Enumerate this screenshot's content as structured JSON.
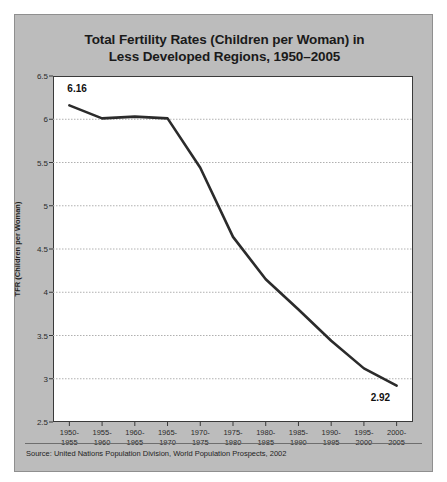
{
  "title": {
    "line1": "Total Fertility Rates (Children per Woman) in",
    "line2": "Less Developed Regions, 1950–2005"
  },
  "source": "Source: United Nations Population Division, World Population Prospects, 2002",
  "colors": {
    "panel_background": "#bcbcbc",
    "plot_background": "#ffffff",
    "line": "#2b2b2b",
    "gridline": "#b0b0b0",
    "axis": "#3a3a3a",
    "text": "#1a1a1a"
  },
  "annotations": {
    "first_value_label": "6.16",
    "last_value_label": "2.92"
  },
  "chart_data": {
    "type": "line",
    "title": "Total Fertility Rates (Children per Woman) in Less Developed Regions, 1950–2005",
    "xlabel": "",
    "ylabel": "TFR (Children per Woman)",
    "ylim": [
      2.5,
      6.5
    ],
    "ytick_labels": [
      "2.5",
      "3",
      "3.5",
      "4",
      "4.5",
      "5",
      "5.5",
      "6",
      "6.5"
    ],
    "yticks": [
      2.5,
      3,
      3.5,
      4,
      4.5,
      5,
      5.5,
      6,
      6.5
    ],
    "grid": true,
    "legend": false,
    "categories": [
      "1950-1955",
      "1955-1960",
      "1960-1965",
      "1965-1970",
      "1970-1975",
      "1975-1980",
      "1980-1985",
      "1985-1990",
      "1990-1995",
      "1995-2000",
      "2000-2005"
    ],
    "category_lines": [
      [
        "1950-",
        "1955"
      ],
      [
        "1955-",
        "1960"
      ],
      [
        "1960-",
        "1965"
      ],
      [
        "1965-",
        "1970"
      ],
      [
        "1970-",
        "1975"
      ],
      [
        "1975-",
        "1980"
      ],
      [
        "1980-",
        "1985"
      ],
      [
        "1985-",
        "1990"
      ],
      [
        "1990-",
        "1995"
      ],
      [
        "1995-",
        "2000"
      ],
      [
        "2000-",
        "2005"
      ]
    ],
    "values": [
      6.16,
      6.01,
      6.03,
      6.01,
      5.44,
      4.64,
      4.15,
      3.8,
      3.44,
      3.12,
      2.92
    ]
  }
}
